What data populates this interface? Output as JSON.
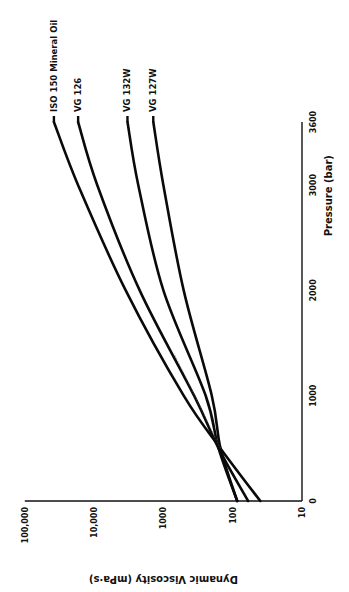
{
  "chart_data": {
    "type": "line",
    "title": "",
    "orientation": "rotated 90° counter-clockwise (pressure axis vertical on right, viscosity axis horizontal along bottom)",
    "xlabel": "Pressure (bar)",
    "ylabel": "Dynamic Viscosity (mPa·s)",
    "xlim": [
      0,
      3600
    ],
    "ylim": [
      10,
      100000
    ],
    "yscale": "log",
    "x_ticks": [
      "0",
      "1000",
      "2000",
      "3000",
      "3600"
    ],
    "y_ticks": [
      "10",
      "100",
      "1000",
      "10,000",
      "100,000"
    ],
    "grid": false,
    "legend": "inline labels at curve ends",
    "x": [
      0,
      500,
      1000,
      2000,
      3000,
      3600
    ],
    "series": [
      {
        "name": "ISO 150 Mineral Oil",
        "values": [
          40,
          150,
          510,
          3500,
          17000,
          38000
        ]
      },
      {
        "name": "VG 126",
        "values": [
          60,
          160,
          360,
          2200,
          9000,
          17000
        ]
      },
      {
        "name": "VG 132W",
        "values": [
          86,
          160,
          245,
          1000,
          2300,
          3300
        ]
      },
      {
        "name": "VG 127W",
        "values": [
          86,
          150,
          200,
          510,
          1000,
          1400
        ]
      }
    ]
  },
  "axes": {
    "pressure": {
      "title": "Pressure (bar)",
      "ticks": [
        {
          "value": 0,
          "label": "0"
        },
        {
          "value": 1000,
          "label": "1000"
        },
        {
          "value": 2000,
          "label": "2000"
        },
        {
          "value": 3000,
          "label": "3000"
        },
        {
          "value": 3600,
          "label": "3600"
        }
      ]
    },
    "viscosity": {
      "title": "Dynamic Viscosity (mPa·s)",
      "ticks": [
        {
          "value": 10,
          "label": "10"
        },
        {
          "value": 100,
          "label": "100"
        },
        {
          "value": 1000,
          "label": "1000"
        },
        {
          "value": 10000,
          "label": "10,000"
        },
        {
          "value": 100000,
          "label": "100,000"
        }
      ]
    }
  },
  "colors": {
    "line": "#0a0a0a",
    "text": "#111111",
    "background": "#ffffff"
  }
}
